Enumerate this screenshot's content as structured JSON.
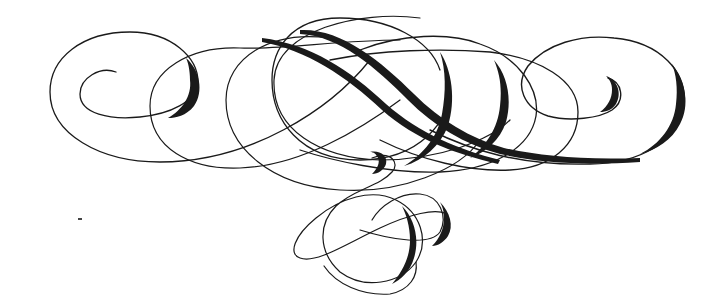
{
  "image": {
    "description": "Decorative calligraphic flourish ornament",
    "background": "#ffffff",
    "ink_color": "#1a1a1a",
    "width": 728,
    "height": 304
  },
  "strokes": [
    {
      "name": "left-outer-spiral",
      "w": 1.3,
      "d": "M116 72 C100 66 80 78 80 94 C80 114 110 120 140 117 C170 114 196 102 198 82 C198 58 172 32 130 32 C82 32 50 58 50 92 C50 134 100 162 160 162 C250 162 330 110 370 60"
    },
    {
      "name": "left-second-loop",
      "w": 1.2,
      "d": "M400 40 C340 40 280 50 240 48 C190 46 150 70 150 106 C150 148 190 170 240 168 C300 166 360 130 400 100"
    },
    {
      "name": "middle-loop-a",
      "w": 1.2,
      "d": "M330 38 C270 30 226 58 226 100 C226 148 272 186 340 190 C400 194 460 170 480 140"
    },
    {
      "name": "middle-loop-b",
      "w": 1.2,
      "d": "M420 18 C360 10 276 30 274 80 C272 130 320 158 380 160 C440 160 490 140 510 120"
    },
    {
      "name": "central-big-oval",
      "w": 1.3,
      "d": "M440 70 C430 40 390 18 340 18 C290 18 272 50 272 80 C272 120 300 160 360 160 C420 160 450 120 450 90"
    },
    {
      "name": "right-outer-spiral",
      "w": 1.4,
      "d": "M608 78 C622 82 626 100 612 110 C600 118 570 122 548 116 C524 108 514 86 528 66 C546 44 580 34 614 38 C660 42 688 72 684 106 C680 140 640 164 590 164 C520 166 470 150 430 130"
    },
    {
      "name": "right-second-loop",
      "w": 1.3,
      "d": "M330 60 C380 50 440 48 490 52 C540 58 578 80 578 112 C578 146 550 168 510 170 C470 172 420 160 380 140"
    },
    {
      "name": "right-middle-loop",
      "w": 1.3,
      "d": "M360 50 C400 34 450 32 480 44 C520 58 540 90 536 116 C530 150 490 170 440 172 C390 174 330 160 300 150"
    },
    {
      "name": "lower-curl",
      "w": 1.2,
      "d": "M372 158 C392 150 400 164 392 172 C380 186 352 190 336 206 C318 224 318 252 340 272 C364 290 400 284 416 262 C430 240 420 212 396 200 C372 188 340 198 316 218 C294 236 288 254 300 258 C316 264 346 244 380 228 C410 214 436 208 446 214"
    },
    {
      "name": "lower-right-loop",
      "w": 1.2,
      "d": "M360 230 C392 240 430 246 440 232 C448 216 440 196 420 194 C400 192 380 206 372 220"
    },
    {
      "name": "bottom-tail",
      "w": 1.2,
      "d": "M324 266 C336 284 362 296 390 294 C410 290 418 276 416 262"
    }
  ],
  "thick_strokes": [
    {
      "name": "diagonal-swash-upper",
      "d": "M262 38 C310 44 350 70 386 104 C420 134 460 150 500 160 L498 164 C456 154 416 140 382 110 C346 76 306 50 262 42 Z"
    },
    {
      "name": "diagonal-swash-lower",
      "d": "M300 30 C340 28 380 60 414 94 C440 120 470 138 504 148 C540 156 580 160 640 158 L640 162 C580 166 536 162 500 154 C464 144 434 126 408 100 C376 68 340 36 300 34 Z"
    },
    {
      "name": "left-spiral-shade",
      "d": "M186 58 C200 70 204 92 194 106 C186 116 176 118 168 118 C182 110 192 96 190 80 C190 70 188 62 186 58 Z"
    },
    {
      "name": "right-spiral-shade",
      "d": "M672 64 C686 82 690 106 680 124 C672 140 656 150 640 154 C660 144 674 126 676 104 C678 88 676 74 672 64 Z"
    },
    {
      "name": "center-oval-shade",
      "d": "M440 52 C452 70 456 100 448 126 C440 146 424 160 404 166 C424 154 438 136 442 114 C446 92 446 70 440 52 Z"
    },
    {
      "name": "right-loop-shade",
      "d": "M494 60 C508 76 512 100 506 122 C500 140 486 152 470 158 C486 146 498 128 500 106 C502 88 500 74 494 60 Z"
    },
    {
      "name": "lower-curl-shade",
      "d": "M402 206 C414 218 420 238 414 258 C410 272 400 280 392 284 C402 272 410 258 410 240 C410 226 406 214 402 206 Z"
    },
    {
      "name": "lower-right-loop-shade",
      "d": "M440 202 C450 212 454 226 448 236 C444 242 438 246 432 246 C440 238 444 228 444 218 C444 210 442 206 440 202 Z"
    },
    {
      "name": "upper-curl-shade",
      "d": "M370 152 C380 150 388 156 386 164 C384 170 378 174 372 174 C378 168 380 162 378 158 C376 154 374 152 370 152 Z"
    },
    {
      "name": "right-small-curl-shade",
      "d": "M606 76 C618 80 622 94 616 104 C612 110 606 112 600 112 C608 106 612 98 612 90 C612 84 610 80 606 76 Z"
    }
  ],
  "stray_mark": {
    "name": "ink-dot",
    "x": 78,
    "y": 218
  }
}
